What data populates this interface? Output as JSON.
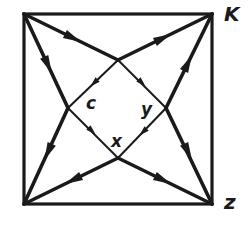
{
  "diagram": {
    "type": "directed-graph-square",
    "colors": {
      "background": "#ffffff",
      "stroke": "#1a1a1a"
    },
    "square": {
      "x1": 24,
      "y1": 14,
      "x2": 212,
      "y2": 204
    },
    "nodes": {
      "top_left": {
        "x": 24,
        "y": 14,
        "label": ""
      },
      "K": {
        "x": 212,
        "y": 14,
        "label": "K"
      },
      "bottom_left": {
        "x": 24,
        "y": 204,
        "label": ""
      },
      "z": {
        "x": 212,
        "y": 204,
        "label": "z"
      },
      "diamond_top": {
        "x": 118,
        "y": 60
      },
      "diamond_left": {
        "x": 68,
        "y": 108
      },
      "diamond_right": {
        "x": 166,
        "y": 108
      },
      "diamond_bottom": {
        "x": 118,
        "y": 158
      }
    },
    "labels": {
      "K": "K",
      "z": "z",
      "c": "c",
      "y": "y",
      "x": "x"
    },
    "edges": [
      {
        "from": "top_left",
        "to": "diamond_top",
        "style": "thick"
      },
      {
        "from": "diamond_top",
        "to": "K",
        "style": "thick"
      },
      {
        "from": "top_left",
        "to": "diamond_left",
        "style": "thick"
      },
      {
        "from": "diamond_left",
        "to": "bottom_left",
        "style": "thick"
      },
      {
        "from": "diamond_right",
        "to": "K",
        "style": "thick"
      },
      {
        "from": "diamond_right",
        "to": "z",
        "style": "thick"
      },
      {
        "from": "diamond_bottom",
        "to": "bottom_left",
        "style": "thick"
      },
      {
        "from": "diamond_bottom",
        "to": "z",
        "style": "thick"
      },
      {
        "from": "diamond_top",
        "to": "diamond_left",
        "style": "thin"
      },
      {
        "from": "diamond_left",
        "to": "diamond_bottom",
        "style": "thin"
      },
      {
        "from": "diamond_top",
        "to": "diamond_right",
        "style": "thin"
      },
      {
        "from": "diamond_right",
        "to": "diamond_bottom",
        "style": "thin"
      }
    ]
  }
}
